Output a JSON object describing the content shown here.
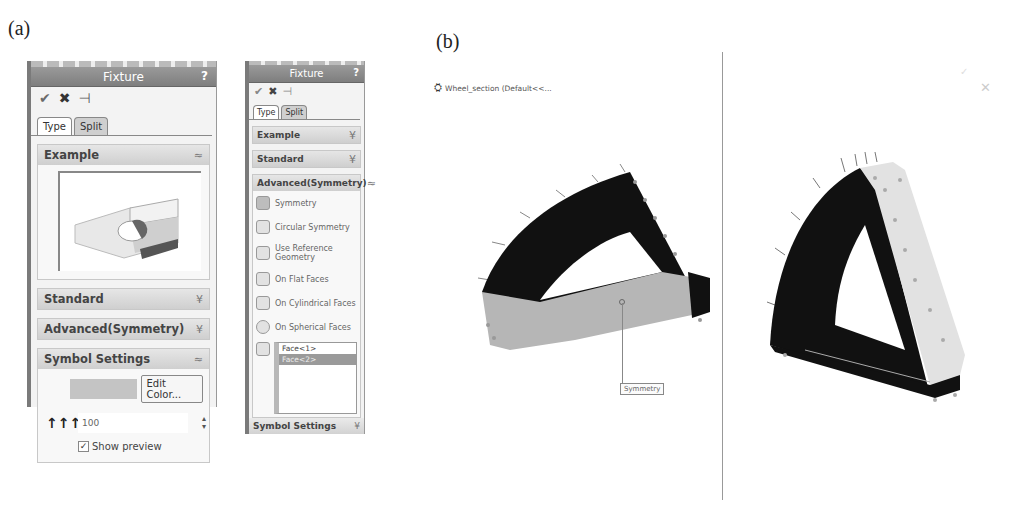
{
  "figure": {
    "label_a": "(a)",
    "label_b": "(b)"
  },
  "panel1": {
    "title": "Fixture",
    "help": "?",
    "actions": {
      "ok_icon": "check-icon",
      "cancel_icon": "x-icon",
      "pin_icon": "pushpin-icon",
      "ok": "✔",
      "cancel": "✖",
      "pin": "⊣"
    },
    "tabs": [
      {
        "label": "Type"
      },
      {
        "label": "Split"
      }
    ],
    "groups": {
      "example": {
        "label": "Example",
        "chevron": "≈"
      },
      "standard": {
        "label": "Standard",
        "chevron": "¥"
      },
      "advanced": {
        "label": "Advanced(Symmetry)",
        "chevron": "¥"
      },
      "symbol": {
        "label": "Symbol Settings",
        "chevron": "≈"
      }
    },
    "symbol_settings": {
      "edit_color": "Edit Color...",
      "size_value": "100",
      "size_icon": "↑↑↑",
      "show_preview": "Show preview",
      "show_preview_checked": true
    }
  },
  "panel2": {
    "title": "Fixture",
    "help": "?",
    "actions": {
      "ok": "✔",
      "cancel": "✖",
      "pin": "⊣"
    },
    "tabs": [
      {
        "label": "Type"
      },
      {
        "label": "Split"
      }
    ],
    "groups": {
      "example": {
        "label": "Example",
        "chevron": "¥"
      },
      "standard": {
        "label": "Standard",
        "chevron": "¥"
      },
      "advanced": {
        "label": "Advanced(Symmetry)",
        "chevron": "≈"
      }
    },
    "options": [
      {
        "label": "Symmetry"
      },
      {
        "label": "Circular Symmetry"
      },
      {
        "label": "Use Reference Geometry"
      },
      {
        "label": "On Flat Faces"
      },
      {
        "label": "On Cylindrical Faces"
      },
      {
        "label": "On Spherical Faces"
      }
    ],
    "faces": [
      {
        "label": "Face<1>",
        "selected": false
      },
      {
        "label": "Face<2>",
        "selected": true
      }
    ],
    "footer": {
      "label": "Symbol Settings",
      "chevron": "¥"
    }
  },
  "viewport": {
    "part_name": "Wheel_section (Default<<...",
    "callout": "Symmetry",
    "close": "✕"
  },
  "colors": {
    "titlebar": "#8a8a8a",
    "group_head": "#d8d8d8",
    "model_dark": "#111111",
    "model_face": "#b5b5b5",
    "model_light": "#e4e4e4"
  }
}
